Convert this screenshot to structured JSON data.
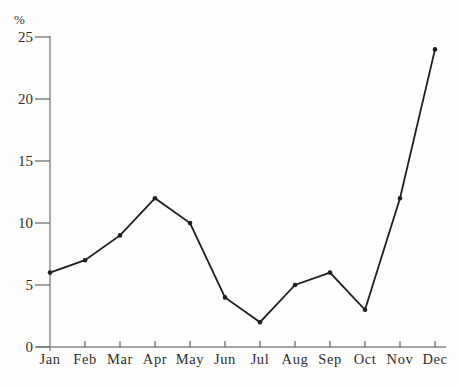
{
  "chart_data": {
    "type": "line",
    "title": "",
    "xlabel": "",
    "ylabel": "%",
    "categories": [
      "Jan",
      "Feb",
      "Mar",
      "Apr",
      "May",
      "Jun",
      "Jul",
      "Aug",
      "Sep",
      "Oct",
      "Nov",
      "Dec"
    ],
    "series": [
      {
        "name": "percentage",
        "values": [
          6,
          7,
          9,
          12,
          10,
          4,
          2,
          5,
          6,
          3,
          12,
          24
        ]
      }
    ],
    "ylim": [
      0,
      25
    ],
    "yticks": [
      0,
      5,
      10,
      15,
      20,
      25
    ],
    "grid": false,
    "legend": "none",
    "marker": "dot",
    "line_color": "#1f1f1f",
    "axis_color": "#868686",
    "tick_color": "#6e6e6e",
    "text_color": "#2e2e2e"
  }
}
